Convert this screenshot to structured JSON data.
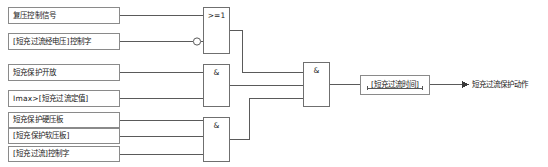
{
  "diagram": {
    "inputs": [
      {
        "label": "复压控制信号",
        "x": 8,
        "y": 7,
        "w": 112,
        "h": 17
      },
      {
        "label": "[短充过流经电压]控制字",
        "x": 8,
        "y": 33,
        "w": 112,
        "h": 17
      },
      {
        "label": "短充保护开放",
        "x": 8,
        "y": 64,
        "w": 112,
        "h": 17
      },
      {
        "label": "Imax>[短充过流定值]",
        "x": 8,
        "y": 90,
        "w": 112,
        "h": 17
      },
      {
        "label": "短充保护硬压板",
        "x": 8,
        "y": 112,
        "w": 112,
        "h": 16
      },
      {
        "label": "[短充保护软压板]",
        "x": 8,
        "y": 128,
        "w": 112,
        "h": 16
      },
      {
        "label": "[短充过流]控制字",
        "x": 8,
        "y": 146,
        "w": 112,
        "h": 16
      }
    ],
    "gates": [
      {
        "name": "or-gate-voltage",
        "symbol": ">=1",
        "x": 203,
        "y": 7,
        "w": 27,
        "h": 47
      },
      {
        "name": "and-gate-current",
        "symbol": "&",
        "x": 203,
        "y": 64,
        "w": 27,
        "h": 43
      },
      {
        "name": "and-gate-enable",
        "symbol": "&",
        "x": 203,
        "y": 117,
        "w": 27,
        "h": 45
      },
      {
        "name": "and-gate-final",
        "symbol": "&",
        "x": 303,
        "y": 62,
        "w": 27,
        "h": 45
      }
    ],
    "timer": {
      "label": "[短充过流时间]",
      "x": 360,
      "y": 75,
      "w": 70,
      "h": 20
    },
    "output": {
      "label": "短充过流保护动作",
      "x": 472,
      "y": 81
    },
    "inverter_bubble": {
      "cx": 197,
      "cy": 45,
      "r": 3.6
    },
    "colors": {
      "box_border": "#8a8a8a",
      "gate_border": "#6f6f6f",
      "wire": "#5a5a5a",
      "text": "#1a1a1a",
      "background": "#ffffff"
    }
  }
}
